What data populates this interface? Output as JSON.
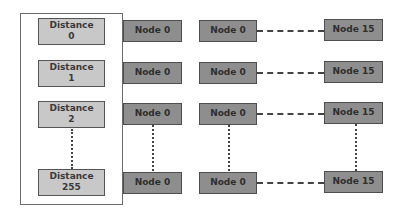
{
  "diagram": {
    "distance_labels": [
      {
        "title": "Distance",
        "value": "0"
      },
      {
        "title": "Distance",
        "value": "1"
      },
      {
        "title": "Distance",
        "value": "2"
      },
      {
        "title": "Distance",
        "value": "255"
      }
    ],
    "rows": [
      {
        "first": "Node 0",
        "second": "Node 0",
        "last": "Node 15"
      },
      {
        "first": "Node 0",
        "second": "Node 0",
        "last": "Node 15"
      },
      {
        "first": "Node 0",
        "second": "Node 0",
        "last": "Node 15"
      },
      {
        "first": "Node 0",
        "second": "Node 0",
        "last": "Node 15"
      }
    ],
    "colors": {
      "distance_fill": "#c8c8c8",
      "node_fill": "#8e8e8e",
      "border": "#4e4e4e"
    }
  }
}
